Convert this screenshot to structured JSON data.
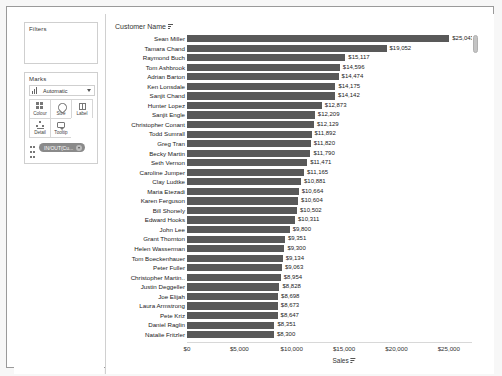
{
  "left_panel": {
    "filters": {
      "title": "Filters"
    },
    "marks": {
      "title": "Marks",
      "type_selector": {
        "label": "Automatic",
        "icon": "bar-chart-icon",
        "caret": "chevron-down-icon"
      },
      "buttons": [
        {
          "label": "Colour",
          "icon": "colour-icon"
        },
        {
          "label": "Size",
          "icon": "size-icon"
        },
        {
          "label": "Label",
          "icon": "label-icon"
        },
        {
          "label": "Detail",
          "icon": "detail-icon"
        },
        {
          "label": "Tooltip",
          "icon": "tooltip-icon"
        }
      ],
      "pill": {
        "text": "IN/OUT(Cu...",
        "drag_handle": "drag-handle-icon",
        "menu": "chevron-down-icon"
      }
    }
  },
  "viz": {
    "field_header": {
      "label": "Customer Name",
      "sort_icon": "sort-descending-icon"
    },
    "scrollbar": {
      "name": "vertical-scrollbar"
    }
  },
  "chart_data": {
    "type": "bar",
    "orientation": "horizontal",
    "title": "",
    "xlabel": "Sales",
    "ylabel": "Customer Name",
    "xlim": [
      0,
      27500
    ],
    "grid": false,
    "legend": "none",
    "value_prefix": "$",
    "xticks": [
      "$0",
      "$5,000",
      "$10,000",
      "$15,000",
      "$20,000",
      "$25,000"
    ],
    "xtick_values": [
      0,
      5000,
      10000,
      15000,
      20000,
      25000
    ],
    "categories": [
      "Sean Miller",
      "Tamara Chand",
      "Raymond Buch",
      "Tom Ashbrook",
      "Adrian Barton",
      "Ken Lonsdale",
      "Sanjit Chand",
      "Hunter Lopez",
      "Sanjit Engle",
      "Christopher Conant",
      "Todd Sumrall",
      "Greg Tran",
      "Becky Martin",
      "Seth Vernon",
      "Caroline Jumper",
      "Clay Ludtke",
      "Maria Etezadi",
      "Karen Ferguson",
      "Bill Shonely",
      "Edward Hooks",
      "John Lee",
      "Grant Thornton",
      "Helen Wasserman",
      "Tom Boeckenhauer",
      "Peter Fuller",
      "Christopher Martin..",
      "Justin Deggeller",
      "Joe Elijah",
      "Laura Armstrong",
      "Pete Kriz",
      "Daniel Raglin",
      "Natalie Fritzler"
    ],
    "values": [
      25043,
      19052,
      15117,
      14596,
      14474,
      14175,
      14142,
      12873,
      12209,
      12129,
      11892,
      11820,
      11790,
      11471,
      11165,
      10881,
      10664,
      10604,
      10502,
      10311,
      9800,
      9351,
      9300,
      9134,
      9063,
      8954,
      8828,
      8698,
      8673,
      8647,
      8351,
      8300
    ],
    "labels": [
      "$25,043",
      "$19,052",
      "$15,117",
      "$14,596",
      "$14,474",
      "$14,175",
      "$14,142",
      "$12,873",
      "$12,209",
      "$12,129",
      "$11,892",
      "$11,820",
      "$11,790",
      "$11,471",
      "$11,165",
      "$10,881",
      "$10,664",
      "$10,604",
      "$10,502",
      "$10,311",
      "$9,800",
      "$9,351",
      "$9,300",
      "$9,134",
      "$9,063",
      "$8,954",
      "$8,828",
      "$8,698",
      "$8,673",
      "$8,647",
      "$8,351",
      "$8,300"
    ],
    "bar_color": "#595959"
  }
}
